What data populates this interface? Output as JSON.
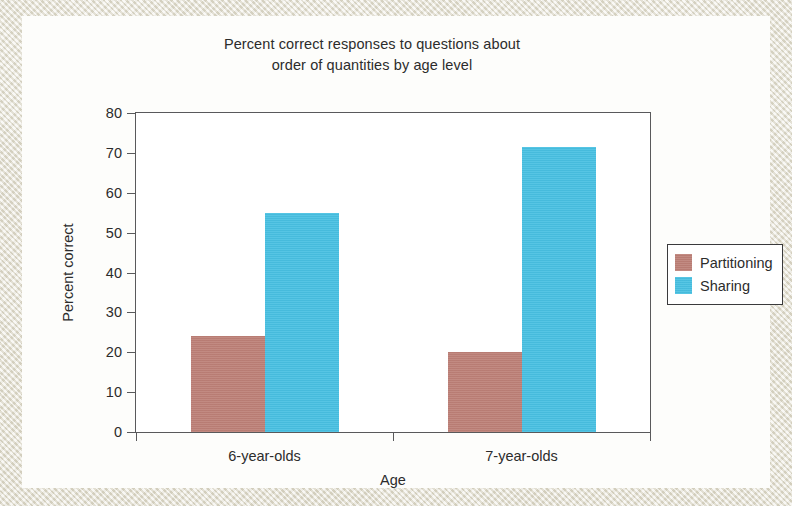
{
  "chart_data": {
    "type": "bar",
    "title": "Percent correct responses to questions about order of quantities by age level",
    "title_lines": [
      "Percent correct responses to questions about",
      "order of quantities by age level"
    ],
    "xlabel": "Age",
    "ylabel": "Percent correct",
    "categories": [
      "6-year-olds",
      "7-year-olds"
    ],
    "series": [
      {
        "name": "Partitioning",
        "color": "#bd8178",
        "values": [
          24,
          20
        ]
      },
      {
        "name": "Sharing",
        "color": "#49c1e2",
        "values": [
          55,
          71.5
        ]
      }
    ],
    "ylim": [
      0,
      80
    ],
    "ytick_step": 10,
    "ytick_labels": [
      "0",
      "10",
      "20",
      "30",
      "40",
      "50",
      "60",
      "70",
      "80"
    ],
    "grid": false,
    "legend_position": "right-outside",
    "frame_color": "#59595b",
    "page_background": "#fdfdfb",
    "border_background": "#e6e2d6"
  }
}
